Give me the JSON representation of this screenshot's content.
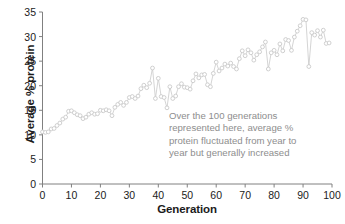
{
  "chart_data": {
    "type": "line",
    "title": "",
    "xlabel": "Generation",
    "ylabel": "Average % protein",
    "xlim": [
      0,
      100
    ],
    "ylim": [
      0,
      35
    ],
    "xticks": [
      0,
      10,
      20,
      30,
      40,
      50,
      60,
      70,
      80,
      90,
      100
    ],
    "yticks": [
      0,
      5,
      10,
      15,
      20,
      25,
      30,
      35
    ],
    "grid": false,
    "legend": "none",
    "marker": "open-circle",
    "series_color": "#c9c9c9",
    "axis_color": "#808080",
    "text_color": "#1b1b1b",
    "annotation_color": "#8e8e8e",
    "x": [
      0,
      1,
      2,
      3,
      4,
      5,
      6,
      7,
      8,
      9,
      10,
      11,
      12,
      13,
      14,
      15,
      16,
      17,
      18,
      19,
      20,
      21,
      22,
      23,
      24,
      25,
      26,
      27,
      28,
      29,
      30,
      31,
      32,
      33,
      34,
      35,
      36,
      37,
      38,
      39,
      40,
      41,
      42,
      43,
      44,
      45,
      46,
      47,
      48,
      49,
      50,
      51,
      52,
      53,
      54,
      55,
      56,
      57,
      58,
      59,
      60,
      61,
      62,
      63,
      64,
      65,
      66,
      67,
      68,
      69,
      70,
      71,
      72,
      73,
      74,
      75,
      76,
      77,
      78,
      79,
      80,
      81,
      82,
      83,
      84,
      85,
      86,
      87,
      88,
      89,
      90,
      91,
      92,
      93,
      94,
      95,
      96,
      97,
      98,
      99
    ],
    "values": [
      10.6,
      10.5,
      10.6,
      11.2,
      11.3,
      11.9,
      12.4,
      13.2,
      13.6,
      14.8,
      14.9,
      14.5,
      14.1,
      13.9,
      13.3,
      13.6,
      14.2,
      14.5,
      14.2,
      14.3,
      15.0,
      14.9,
      15.1,
      14.9,
      13.9,
      15.6,
      16.2,
      16.6,
      16.0,
      16.6,
      17.6,
      17.8,
      17.4,
      17.9,
      19.4,
      20.1,
      19.6,
      20.5,
      23.6,
      17.4,
      21.5,
      17.8,
      17.6,
      15.5,
      19.8,
      17.4,
      17.9,
      19.8,
      20.4,
      19.7,
      19.6,
      19.3,
      21.0,
      22.4,
      21.6,
      22.2,
      22.3,
      20.2,
      19.8,
      22.5,
      24.8,
      23.0,
      23.6,
      24.4,
      24.0,
      24.6,
      23.9,
      23.4,
      25.5,
      27.1,
      26.1,
      27.3,
      26.7,
      25.2,
      26.3,
      26.9,
      27.9,
      28.9,
      23.4,
      26.7,
      27.2,
      26.3,
      28.5,
      27.1,
      29.4,
      29.2,
      27.2,
      29.9,
      31.1,
      32.2,
      33.5,
      33.4,
      23.9,
      30.8,
      30.3,
      31.2,
      29.9,
      31.3,
      28.6,
      28.7
    ],
    "annotation": {
      "lines": [
        "Over the 100 generations",
        "represented here, average %",
        "protein fluctuated from year to",
        "year but generally increased"
      ]
    }
  }
}
